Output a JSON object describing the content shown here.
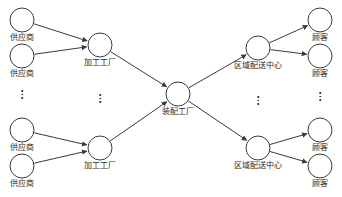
{
  "diagram": {
    "type": "supply-chain-network",
    "canvas": {
      "width": 342,
      "height": 197,
      "background": "#ffffff"
    },
    "style": {
      "node_stroke": "#3a3a3a",
      "node_fill": "#ffffff",
      "edge_color": "#3a3a3a",
      "label_color": "#2b2b2b"
    },
    "layers": [
      {
        "key": "supplier",
        "label": "供应商",
        "x": 22
      },
      {
        "key": "processing_plant",
        "label": "加工工厂",
        "x": 100
      },
      {
        "key": "assembly_plant",
        "label": "装配工厂",
        "x": 178
      },
      {
        "key": "distribution_center",
        "label": "区域配送中心",
        "x": 258
      },
      {
        "key": "customer",
        "label": "顾客",
        "x": 320
      }
    ],
    "nodes": [
      {
        "id": "s1",
        "layer": "supplier",
        "label": "供应商",
        "cx": 22,
        "cy": 20,
        "r": 12
      },
      {
        "id": "s2",
        "layer": "supplier",
        "label": "供应商",
        "cx": 22,
        "cy": 56,
        "r": 12
      },
      {
        "id": "s3",
        "layer": "supplier",
        "label": "供应商",
        "cx": 22,
        "cy": 130,
        "r": 12
      },
      {
        "id": "s4",
        "layer": "supplier",
        "label": "供应商",
        "cx": 22,
        "cy": 166,
        "r": 12
      },
      {
        "id": "p1",
        "layer": "processing_plant",
        "label": "加工工厂",
        "cx": 100,
        "cy": 45,
        "r": 12
      },
      {
        "id": "p2",
        "layer": "processing_plant",
        "label": "加工工厂",
        "cx": 100,
        "cy": 148,
        "r": 12
      },
      {
        "id": "a1",
        "layer": "assembly_plant",
        "label": "装配工厂",
        "cx": 178,
        "cy": 94,
        "r": 12
      },
      {
        "id": "d1",
        "layer": "distribution_center",
        "label": "区域配送中心",
        "cx": 258,
        "cy": 48,
        "r": 12
      },
      {
        "id": "d2",
        "layer": "distribution_center",
        "label": "区域配送中心",
        "cx": 258,
        "cy": 148,
        "r": 12
      },
      {
        "id": "c1",
        "layer": "customer",
        "label": "顾客",
        "cx": 320,
        "cy": 20,
        "r": 12
      },
      {
        "id": "c2",
        "layer": "customer",
        "label": "顾客",
        "cx": 320,
        "cy": 56,
        "r": 12
      },
      {
        "id": "c3",
        "layer": "customer",
        "label": "顾客",
        "cx": 320,
        "cy": 130,
        "r": 12
      },
      {
        "id": "c4",
        "layer": "customer",
        "label": "顾客",
        "cx": 320,
        "cy": 166,
        "r": 12
      }
    ],
    "edges": [
      {
        "from": "s1",
        "to": "p1"
      },
      {
        "from": "s2",
        "to": "p1"
      },
      {
        "from": "s3",
        "to": "p2"
      },
      {
        "from": "s4",
        "to": "p2"
      },
      {
        "from": "p1",
        "to": "a1"
      },
      {
        "from": "p2",
        "to": "a1"
      },
      {
        "from": "a1",
        "to": "d1"
      },
      {
        "from": "a1",
        "to": "d2"
      },
      {
        "from": "d1",
        "to": "c1"
      },
      {
        "from": "d1",
        "to": "c2"
      },
      {
        "from": "d2",
        "to": "c3"
      },
      {
        "from": "d2",
        "to": "c4"
      }
    ],
    "ellipses": [
      {
        "id": "e-supplier",
        "after_layer": "supplier",
        "x": 22,
        "y": 88,
        "glyph": "⋮"
      },
      {
        "id": "e-processing",
        "after_layer": "processing_plant",
        "x": 100,
        "y": 92,
        "glyph": "⋮"
      },
      {
        "id": "e-distribution",
        "after_layer": "distribution_center",
        "x": 258,
        "y": 94,
        "glyph": "⋮"
      },
      {
        "id": "e-customer",
        "after_layer": "customer",
        "x": 320,
        "y": 90,
        "glyph": "⋮"
      }
    ]
  }
}
